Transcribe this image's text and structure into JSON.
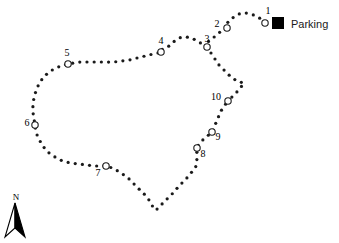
{
  "map": {
    "title": "Trail Map with Numbered Stops",
    "background_color": "#ffffff",
    "trail_color": "#1a1a1a",
    "marker_outline_color": "#1a1a1a",
    "marker_fill_color": "#ffffff",
    "dot_radius": 1.6,
    "marker_radius": 3.2
  },
  "legend": {
    "parking_label": "Parking",
    "parking_symbol": "black-square",
    "parking_symbol_color": "#000000"
  },
  "north_arrow": {
    "label": "N",
    "symbol": "north-arrow-icon"
  },
  "stops": [
    {
      "id": 1,
      "label": "1",
      "x": 265,
      "y": 23,
      "label_x": 268,
      "label_y": 14
    },
    {
      "id": 2,
      "label": "2",
      "x": 227,
      "y": 28,
      "label_x": 217,
      "label_y": 27
    },
    {
      "id": 3,
      "label": "3",
      "x": 207,
      "y": 47,
      "label_x": 207,
      "label_y": 42
    },
    {
      "id": 4,
      "label": "4",
      "x": 161,
      "y": 52,
      "label_x": 161,
      "label_y": 44
    },
    {
      "id": 5,
      "label": "5",
      "x": 68,
      "y": 64,
      "label_x": 67,
      "label_y": 56
    },
    {
      "id": 6,
      "label": "6",
      "x": 35,
      "y": 125,
      "label_x": 27,
      "label_y": 126
    },
    {
      "id": 7,
      "label": "7",
      "x": 106,
      "y": 166,
      "label_x": 98,
      "label_y": 176
    },
    {
      "id": 8,
      "label": "8",
      "x": 197,
      "y": 148,
      "label_x": 203,
      "label_y": 157
    },
    {
      "id": 9,
      "label": "9",
      "x": 212,
      "y": 132,
      "label_x": 218,
      "label_y": 140
    },
    {
      "id": 10,
      "label": "10",
      "x": 228,
      "y": 101,
      "label_x": 216,
      "label_y": 100
    }
  ],
  "trail_segments": [
    {
      "name": "outer-loop",
      "points": [
        [
          265,
          23
        ],
        [
          258,
          17
        ],
        [
          250,
          14
        ],
        [
          242,
          13
        ],
        [
          234,
          17
        ],
        [
          228,
          22
        ],
        [
          227,
          28
        ],
        [
          220,
          32
        ],
        [
          213,
          38
        ],
        [
          207,
          43
        ],
        [
          207,
          47
        ],
        [
          199,
          42
        ],
        [
          191,
          38
        ],
        [
          183,
          37
        ],
        [
          176,
          40
        ],
        [
          169,
          46
        ],
        [
          161,
          50
        ],
        [
          161,
          52
        ],
        [
          153,
          54
        ],
        [
          145,
          56
        ],
        [
          137,
          58
        ],
        [
          129,
          60
        ],
        [
          121,
          61
        ],
        [
          113,
          62
        ],
        [
          105,
          62
        ],
        [
          97,
          62
        ],
        [
          89,
          62
        ],
        [
          81,
          62
        ],
        [
          74,
          63
        ],
        [
          68,
          64
        ],
        [
          61,
          66
        ],
        [
          54,
          69
        ],
        [
          48,
          73
        ],
        [
          43,
          78
        ],
        [
          39,
          84
        ],
        [
          36,
          91
        ],
        [
          34,
          98
        ],
        [
          33,
          105
        ],
        [
          33,
          112
        ],
        [
          34,
          119
        ],
        [
          35,
          125
        ],
        [
          36,
          132
        ],
        [
          39,
          139
        ],
        [
          43,
          146
        ],
        [
          48,
          152
        ],
        [
          55,
          157
        ],
        [
          63,
          161
        ],
        [
          71,
          163
        ],
        [
          79,
          164
        ],
        [
          87,
          165
        ],
        [
          95,
          166
        ],
        [
          106,
          166
        ],
        [
          114,
          169
        ],
        [
          121,
          173
        ],
        [
          128,
          178
        ],
        [
          134,
          184
        ],
        [
          140,
          190
        ],
        [
          146,
          196
        ],
        [
          151,
          203
        ],
        [
          155,
          210
        ],
        [
          161,
          205
        ],
        [
          167,
          199
        ],
        [
          173,
          193
        ],
        [
          179,
          186
        ],
        [
          185,
          180
        ],
        [
          191,
          173
        ],
        [
          196,
          166
        ],
        [
          197,
          156
        ],
        [
          197,
          148
        ],
        [
          201,
          142
        ],
        [
          206,
          137
        ],
        [
          212,
          132
        ],
        [
          215,
          125
        ],
        [
          218,
          118
        ],
        [
          221,
          111
        ],
        [
          225,
          105
        ],
        [
          228,
          101
        ]
      ]
    },
    {
      "name": "spur-from-stop3-to-stop10",
      "points": [
        [
          207,
          47
        ],
        [
          211,
          53
        ],
        [
          215,
          59
        ],
        [
          219,
          65
        ],
        [
          224,
          70
        ],
        [
          229,
          75
        ],
        [
          234,
          79
        ],
        [
          239,
          82
        ],
        [
          244,
          83
        ],
        [
          240,
          88
        ],
        [
          236,
          93
        ],
        [
          232,
          97
        ],
        [
          228,
          101
        ]
      ]
    }
  ]
}
